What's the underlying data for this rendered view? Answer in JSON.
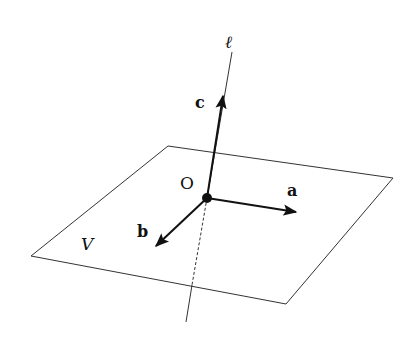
{
  "diagram": {
    "labels": {
      "line": "ℓ",
      "vector_c": "c",
      "vector_a": "a",
      "vector_b": "b",
      "origin": "O",
      "plane": "V"
    },
    "colors": {
      "ink": "#111111",
      "background": "#ffffff"
    }
  }
}
